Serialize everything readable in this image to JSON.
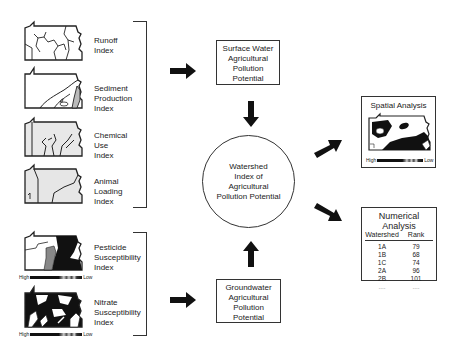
{
  "surface_indices": [
    {
      "id": "runoff",
      "lines": [
        "Runoff",
        "Index"
      ]
    },
    {
      "id": "sediment",
      "lines": [
        "Sediment",
        "Production",
        "Index"
      ]
    },
    {
      "id": "chemical",
      "lines": [
        "Chemical",
        "Use",
        "Index"
      ]
    },
    {
      "id": "animal",
      "lines": [
        "Animal",
        "Loading",
        "Index"
      ]
    }
  ],
  "ground_indices": [
    {
      "id": "pesticide",
      "lines": [
        "Pesticide",
        "Susceptibility",
        "Index"
      ]
    },
    {
      "id": "nitrate",
      "lines": [
        "Nitrate",
        "Susceptibility",
        "Index"
      ]
    }
  ],
  "legend": {
    "high": "High",
    "low": "Low"
  },
  "surface_box": {
    "lines": [
      "Surface Water",
      "Agricultural",
      "Pollution",
      "Potential"
    ]
  },
  "ground_box": {
    "lines": [
      "Groundwater",
      "Agricultural",
      "Pollution",
      "Potential"
    ]
  },
  "central": {
    "lines": [
      "Watershed",
      "Index of",
      "Agricultural",
      "Pollution Potential"
    ]
  },
  "spatial": {
    "title": "Spatial Analysis",
    "high": "High",
    "low": "Low"
  },
  "numerical": {
    "title": "Numerical Analysis",
    "columns": [
      "Watershed",
      "Rank"
    ],
    "rows": [
      [
        "1A",
        "79"
      ],
      [
        "1B",
        "68"
      ],
      [
        "1C",
        "74"
      ],
      [
        "2A",
        "96"
      ],
      [
        "2B",
        "101"
      ],
      [
        "....",
        "...."
      ]
    ]
  }
}
